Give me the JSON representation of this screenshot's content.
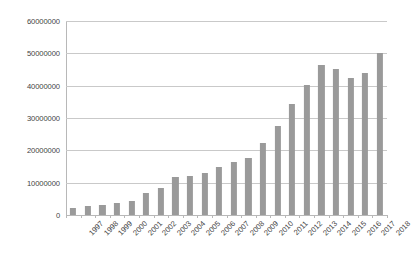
{
  "chart_data": {
    "type": "bar",
    "title": "",
    "xlabel": "",
    "ylabel": "",
    "ylim": [
      0,
      60000000
    ],
    "grid": true,
    "legend": false,
    "bar_color": "#9a9a9a",
    "gridline_color": "#c9c9c9",
    "axis_color": "#b8b8b8",
    "ytick_labels": [
      "60000000",
      "50000000",
      "40000000",
      "30000000",
      "20000000",
      "10000000",
      "0"
    ],
    "ytick_values": [
      60000000,
      50000000,
      40000000,
      30000000,
      20000000,
      10000000,
      0
    ],
    "categories": [
      "1997",
      "1998",
      "1999",
      "2000",
      "2001",
      "2002",
      "2003",
      "2004",
      "2005",
      "2006",
      "2007",
      "2008",
      "2009",
      "2010",
      "2011",
      "2012",
      "2013",
      "2014",
      "2015",
      "2016",
      "2017",
      "2018"
    ],
    "values": [
      2200000,
      2700000,
      3100000,
      3800000,
      4400000,
      6800000,
      8300000,
      11800000,
      12100000,
      13100000,
      15000000,
      16400000,
      17500000,
      22300000,
      27600000,
      34300000,
      40200000,
      46500000,
      45100000,
      42300000,
      44000000,
      50200000
    ]
  }
}
